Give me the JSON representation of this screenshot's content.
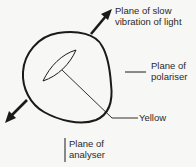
{
  "diagram": {
    "labels": {
      "slow_vibration": {
        "line1": "Plane of slow",
        "line2": "vibration of light"
      },
      "polariser": {
        "line1": "Plane of",
        "line2": "polariser"
      },
      "yellow": "Yellow",
      "analyser": {
        "line1": "Plane of",
        "line2": "analyser"
      }
    },
    "elements": [
      {
        "id": "crystal-outline",
        "type": "closed-curve"
      },
      {
        "id": "interference-lens",
        "type": "ellipse",
        "color_label": "Yellow"
      },
      {
        "id": "slow-vibration-arrow",
        "type": "double-ended-arrow",
        "direction": "NE-SW"
      },
      {
        "id": "polariser-plane-line",
        "type": "horizontal-line"
      },
      {
        "id": "analyser-plane-line",
        "type": "vertical-line"
      }
    ],
    "colors": {
      "background": "#f7f7f5",
      "stroke": "#1a1a1a",
      "text": "#2a2a2a"
    }
  }
}
